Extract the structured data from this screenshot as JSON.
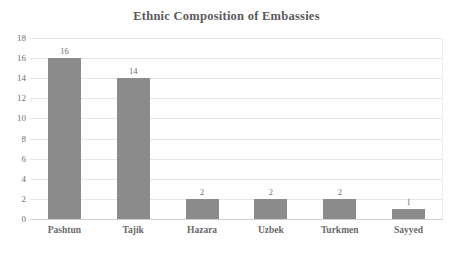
{
  "chart_data": {
    "type": "bar",
    "title": "Ethnic Composition of Embassies",
    "xlabel": "",
    "ylabel": "",
    "categories": [
      "Pashtun",
      "Tajik",
      "Hazara",
      "Uzbek",
      "Turkmen",
      "Sayyed"
    ],
    "values": [
      16,
      14,
      2,
      2,
      2,
      1
    ],
    "data_labels": [
      "16",
      "14",
      "2",
      "2",
      "2",
      "1"
    ],
    "ylim": [
      0,
      18
    ],
    "ytick_step": 2,
    "ytick_labels": [
      "18",
      "16",
      "14",
      "12",
      "10",
      "8",
      "6",
      "4",
      "2",
      "0"
    ],
    "ytick_values": [
      18,
      16,
      14,
      12,
      10,
      8,
      6,
      4,
      2,
      0
    ],
    "grid": true,
    "grid_axis": "y",
    "legend": false,
    "legend_position": "none",
    "series": [
      {
        "name": "Embassy staff count",
        "values": [
          16,
          14,
          2,
          2,
          2,
          1
        ]
      }
    ]
  },
  "colors": {
    "bar_fill": "#8b8b8b",
    "gridline": "#e6e6e6",
    "baseline": "#d0d0d0",
    "title_text": "#5a5a5a",
    "tick_text": "#6e6e6e",
    "category_text": "#6a6a6a",
    "background": "#ffffff"
  }
}
